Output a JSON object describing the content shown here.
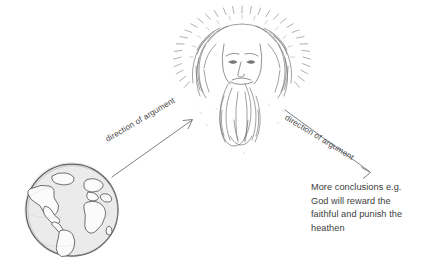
{
  "figure": {
    "background_color": "#ffffff",
    "ink_color": "#555555",
    "text_color": "#3c3c3c"
  },
  "illustrations": {
    "globe": {
      "name": "earth-globe-sketch",
      "description": "Hand-drawn sketch of planet Earth showing the Americas, Europe and Africa",
      "fill_color": "#eaeaea",
      "outline_color": "#5a5a5a",
      "center_x": 72,
      "center_y": 210,
      "radius": 47
    },
    "deity": {
      "name": "bearded-god-sketch",
      "description": "Hand-drawn bearded face of God with long flowing hair and a radiant halo of rays",
      "outline_color": "#6a6a6a",
      "center_x": 242,
      "center_y": 72,
      "halo_radius": 57
    }
  },
  "arrows": [
    {
      "name": "arrow-earth-to-god",
      "label": "direction of argument",
      "from": "earth-globe-sketch",
      "to": "bearded-god-sketch",
      "x1": 112,
      "y1": 177,
      "x2": 192,
      "y2": 120,
      "color": "#666666"
    },
    {
      "name": "arrow-god-to-conclusions",
      "label": "direction of argument",
      "from": "bearded-god-sketch",
      "to": "conclusions-text",
      "x1": 285,
      "y1": 110,
      "x2": 370,
      "y2": 172,
      "color": "#666666"
    }
  ],
  "conclusions": {
    "name": "conclusions-text",
    "lines": [
      "More conclusions e.g.",
      "God will reward the",
      "faithful and punish the",
      "heathen"
    ]
  }
}
